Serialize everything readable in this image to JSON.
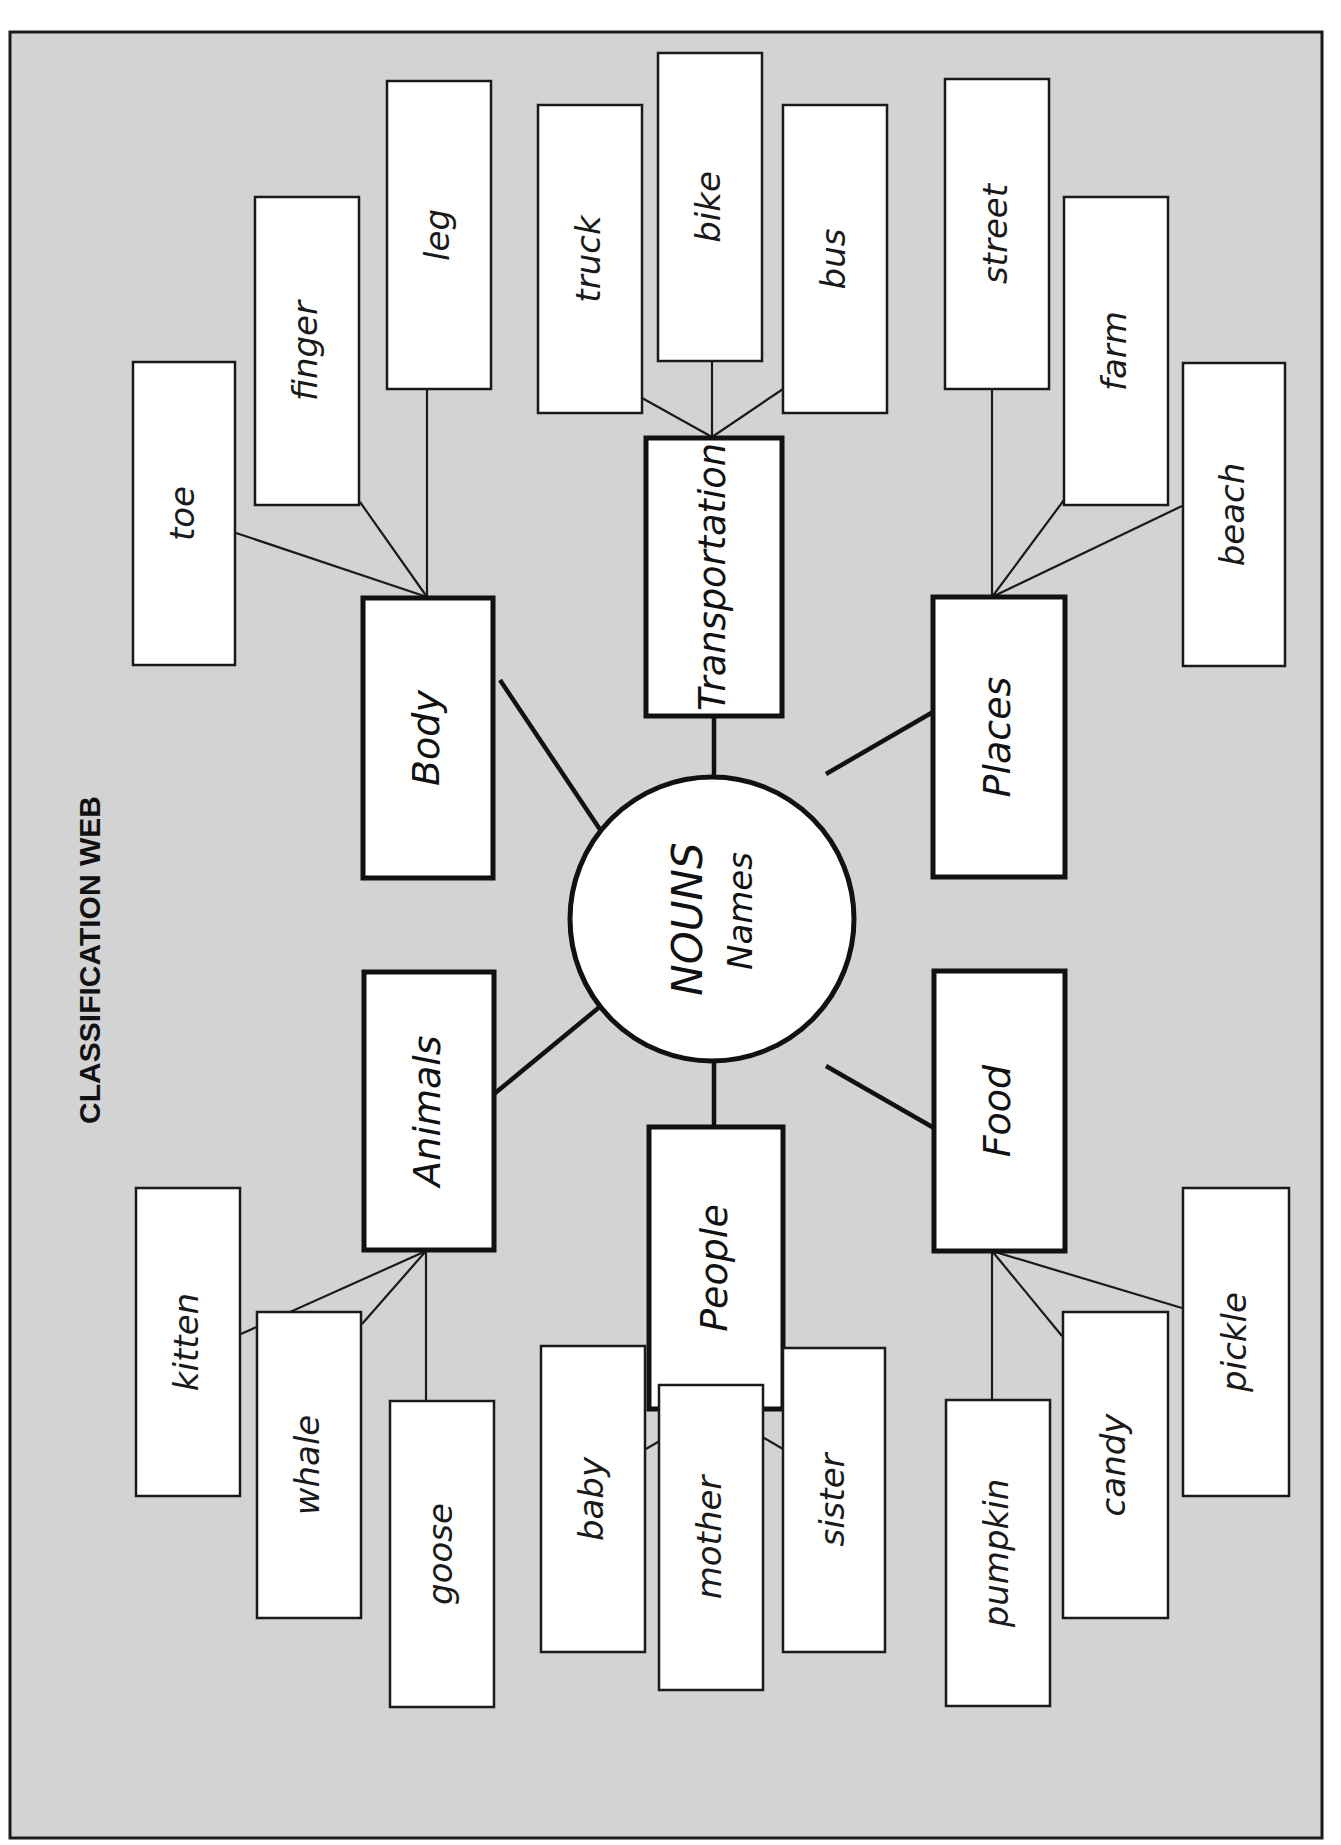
{
  "page": {
    "title": "CLASSIFICATION WEB",
    "orientation": "rotated -90deg (landscape worksheet)",
    "colors": {
      "background": "#d3d3d3",
      "box_fill": "#ffffff",
      "stroke": "#111111"
    }
  },
  "frame": {
    "x": 10,
    "y": 32,
    "w": 1312,
    "h": 1806
  },
  "title_pos": {
    "x": 92,
    "y": 960
  },
  "hub": {
    "title": "NOUNS",
    "subtitle": "Names",
    "cx": 712,
    "cy": 919,
    "r": 142
  },
  "categories": [
    {
      "label": "Body",
      "x": 363,
      "y": 598,
      "w": 130,
      "h": 280,
      "spoke": [
        500,
        680,
        607,
        840
      ],
      "leaves": [
        {
          "label": "toe",
          "x": 133,
          "y": 362,
          "w": 102,
          "h": 303
        },
        {
          "label": "finger",
          "x": 255,
          "y": 197,
          "w": 104,
          "h": 308
        },
        {
          "label": "leg",
          "x": 387,
          "y": 81,
          "w": 104,
          "h": 308
        }
      ],
      "anchor": [
        427,
        597
      ]
    },
    {
      "label": "Transportation",
      "x": 646,
      "y": 438,
      "w": 136,
      "h": 278,
      "spoke": [
        714,
        716,
        714,
        777
      ],
      "leaves": [
        {
          "label": "truck",
          "x": 538,
          "y": 105,
          "w": 104,
          "h": 308
        },
        {
          "label": "bike",
          "x": 658,
          "y": 53,
          "w": 104,
          "h": 308
        },
        {
          "label": "bus",
          "x": 783,
          "y": 105,
          "w": 104,
          "h": 308
        }
      ],
      "anchor": [
        712,
        437
      ]
    },
    {
      "label": "Places",
      "x": 933,
      "y": 597,
      "w": 132,
      "h": 280,
      "spoke": [
        933,
        712,
        826,
        774
      ],
      "leaves": [
        {
          "label": "street",
          "x": 945,
          "y": 79,
          "w": 104,
          "h": 310
        },
        {
          "label": "farm",
          "x": 1064,
          "y": 197,
          "w": 104,
          "h": 308
        },
        {
          "label": "beach",
          "x": 1183,
          "y": 363,
          "w": 102,
          "h": 303
        }
      ],
      "anchor": [
        992,
        597
      ]
    },
    {
      "label": "Animals",
      "x": 364,
      "y": 972,
      "w": 130,
      "h": 278,
      "spoke": [
        494,
        1094,
        602,
        1005
      ],
      "leaves": [
        {
          "label": "kitten",
          "x": 136,
          "y": 1188,
          "w": 104,
          "h": 308
        },
        {
          "label": "whale",
          "x": 257,
          "y": 1312,
          "w": 104,
          "h": 306
        },
        {
          "label": "goose",
          "x": 390,
          "y": 1401,
          "w": 104,
          "h": 306
        }
      ],
      "anchor": [
        426,
        1251
      ]
    },
    {
      "label": "People",
      "x": 649,
      "y": 1127,
      "w": 134,
      "h": 282,
      "spoke": [
        714,
        1062,
        714,
        1126
      ],
      "leaves": [
        {
          "label": "baby",
          "x": 541,
          "y": 1346,
          "w": 104,
          "h": 306
        },
        {
          "label": "mother",
          "x": 659,
          "y": 1385,
          "w": 104,
          "h": 305
        },
        {
          "label": "sister",
          "x": 783,
          "y": 1348,
          "w": 102,
          "h": 304
        }
      ],
      "anchor": [
        714,
        1409
      ]
    },
    {
      "label": "Food",
      "x": 934,
      "y": 971,
      "w": 131,
      "h": 280,
      "spoke": [
        826,
        1066,
        934,
        1128
      ],
      "leaves": [
        {
          "label": "pumpkin",
          "x": 946,
          "y": 1400,
          "w": 104,
          "h": 306
        },
        {
          "label": "candy",
          "x": 1063,
          "y": 1312,
          "w": 105,
          "h": 306
        },
        {
          "label": "pickle",
          "x": 1183,
          "y": 1188,
          "w": 106,
          "h": 308
        }
      ],
      "anchor": [
        992,
        1251
      ]
    }
  ],
  "twigs": [
    [
      [
        427,
        597
      ],
      [
        236,
        533
      ]
    ],
    [
      [
        427,
        597
      ],
      [
        360,
        502
      ]
    ],
    [
      [
        427,
        597
      ],
      [
        427,
        389
      ]
    ],
    [
      [
        712,
        437
      ],
      [
        642,
        398
      ]
    ],
    [
      [
        712,
        437
      ],
      [
        712,
        361
      ]
    ],
    [
      [
        712,
        437
      ],
      [
        783,
        389
      ]
    ],
    [
      [
        992,
        597
      ],
      [
        992,
        389
      ]
    ],
    [
      [
        992,
        597
      ],
      [
        1064,
        500
      ]
    ],
    [
      [
        992,
        597
      ],
      [
        1182,
        506
      ]
    ],
    [
      [
        426,
        1251
      ],
      [
        241,
        1334
      ]
    ],
    [
      [
        426,
        1251
      ],
      [
        362,
        1324
      ]
    ],
    [
      [
        426,
        1251
      ],
      [
        426,
        1401
      ]
    ],
    [
      [
        714,
        1409
      ],
      [
        646,
        1449
      ]
    ],
    [
      [
        714,
        1409
      ],
      [
        714,
        1385
      ]
    ],
    [
      [
        714,
        1409
      ],
      [
        783,
        1449
      ]
    ],
    [
      [
        992,
        1251
      ],
      [
        992,
        1400
      ]
    ],
    [
      [
        992,
        1251
      ],
      [
        1062,
        1336
      ]
    ],
    [
      [
        992,
        1251
      ],
      [
        1182,
        1308
      ]
    ]
  ]
}
